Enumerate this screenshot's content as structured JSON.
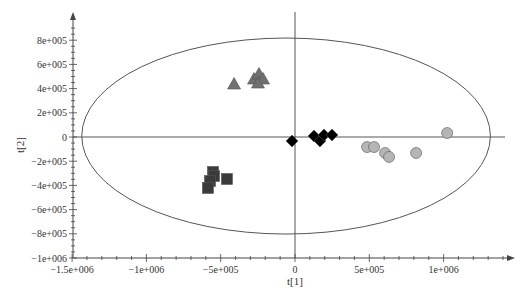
{
  "chart_data": {
    "type": "scatter",
    "title": "",
    "xlabel": "t[1]",
    "ylabel": "t[2]",
    "xlim": [
      -1500000,
      1500000
    ],
    "ylim": [
      -1000000,
      950000
    ],
    "grid": false,
    "legend": null,
    "x_ticks": [
      {
        "value": -1500000,
        "label": "−1.5e+006"
      },
      {
        "value": -1000000,
        "label": "−1e+006"
      },
      {
        "value": -500000,
        "label": "−5e+005"
      },
      {
        "value": 0,
        "label": "0"
      },
      {
        "value": 500000,
        "label": "5e+005"
      },
      {
        "value": 1000000,
        "label": "1e+006"
      }
    ],
    "y_ticks": [
      {
        "value": 800000,
        "label": "8e+005"
      },
      {
        "value": 600000,
        "label": "6e+005"
      },
      {
        "value": 400000,
        "label": "4e+005"
      },
      {
        "value": 200000,
        "label": "2e+005"
      },
      {
        "value": 0,
        "label": "0"
      },
      {
        "value": -200000,
        "label": "−2e+005"
      },
      {
        "value": -400000,
        "label": "−4e+005"
      },
      {
        "value": -600000,
        "label": "−6e+005"
      },
      {
        "value": -800000,
        "label": "−8e+005"
      },
      {
        "value": -1000000,
        "label": "−1e+006"
      }
    ],
    "ellipse": {
      "label": "Hotelling T2 95% ellipse",
      "cx": -60000,
      "cy": 8000,
      "rx": 1375000,
      "ry": 810000
    },
    "series": [
      {
        "name": "group-triangle",
        "marker": "triangle",
        "color": "#707070",
        "points": [
          [
            -410000,
            438000
          ],
          [
            -276000,
            479000
          ],
          [
            -242000,
            521000
          ],
          [
            -215000,
            479000
          ],
          [
            -249000,
            446000
          ]
        ]
      },
      {
        "name": "group-square",
        "marker": "square",
        "color": "#3a3a3a",
        "points": [
          [
            -552000,
            -289000
          ],
          [
            -545000,
            -322000
          ],
          [
            -572000,
            -364000
          ],
          [
            -586000,
            -421000
          ],
          [
            -458000,
            -347000
          ]
        ]
      },
      {
        "name": "group-diamond",
        "marker": "diamond",
        "color": "#000000",
        "points": [
          [
            -20000,
            -33000
          ],
          [
            128000,
            8000
          ],
          [
            168000,
            -33000
          ],
          [
            195000,
            17000
          ],
          [
            249000,
            17000
          ]
        ]
      },
      {
        "name": "group-circle",
        "marker": "circle",
        "color": "#b5b5b5",
        "points": [
          [
            485000,
            -83000
          ],
          [
            532000,
            -83000
          ],
          [
            606000,
            -132000
          ],
          [
            633000,
            -165000
          ],
          [
            815000,
            -132000
          ],
          [
            1024000,
            33000
          ]
        ]
      }
    ]
  },
  "plot_area": {
    "origin_px": [
      295,
      137
    ],
    "x_px_per_unit": 0.0001486,
    "y_px_per_unit": 0.000121,
    "y_axis_x_px": 73,
    "x_axis_y_px": 258
  },
  "colors": {
    "axis": "#444444",
    "ellipse": "#555555",
    "background": "#ffffff"
  }
}
